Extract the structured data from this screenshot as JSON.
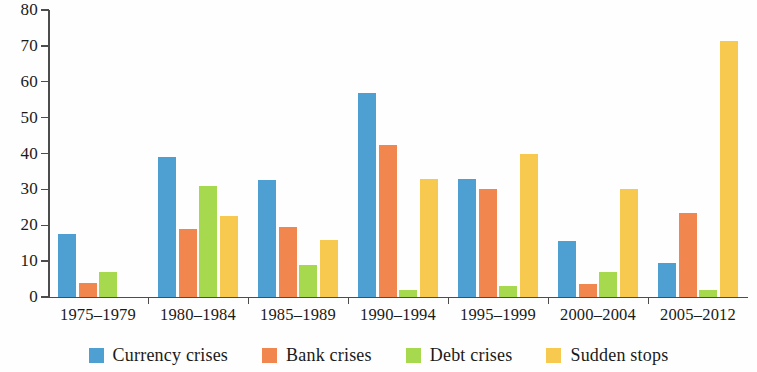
{
  "chart_data": {
    "type": "bar",
    "title": "",
    "subtitle": "",
    "xlabel": "",
    "ylabel": "",
    "ylim": [
      0,
      80
    ],
    "yticks": [
      0,
      10,
      20,
      30,
      40,
      50,
      60,
      70,
      80
    ],
    "grid": false,
    "legend_position": "bottom",
    "categories": [
      "1975–1979",
      "1980–1984",
      "1985–1989",
      "1990–1994",
      "1995–1999",
      "2000–2004",
      "2005–2012"
    ],
    "series": [
      {
        "name": "Currency crises",
        "color": "#4e9fd2",
        "values": [
          17.5,
          39,
          32.5,
          57,
          33,
          15.5,
          9.5
        ]
      },
      {
        "name": "Bank crises",
        "color": "#f2864f",
        "values": [
          4,
          19,
          19.5,
          42.5,
          30,
          3.5,
          23.5
        ]
      },
      {
        "name": "Debt crises",
        "color": "#a6d94e",
        "values": [
          7,
          31,
          9,
          2,
          3,
          7,
          2
        ]
      },
      {
        "name": "Sudden stops",
        "color": "#f7c94f",
        "values": [
          0,
          22.5,
          16,
          33,
          40,
          30,
          71.5
        ]
      }
    ]
  },
  "axis": {
    "y_tick_labels": [
      "80",
      "70",
      "60",
      "50",
      "40",
      "30",
      "20",
      "10",
      "0"
    ]
  },
  "legend": {
    "items": [
      {
        "label": "Currency crises",
        "color": "#4e9fd2"
      },
      {
        "label": "Bank crises",
        "color": "#f2864f"
      },
      {
        "label": "Debt crises",
        "color": "#a6d94e"
      },
      {
        "label": "Sudden stops",
        "color": "#f7c94f"
      }
    ]
  }
}
